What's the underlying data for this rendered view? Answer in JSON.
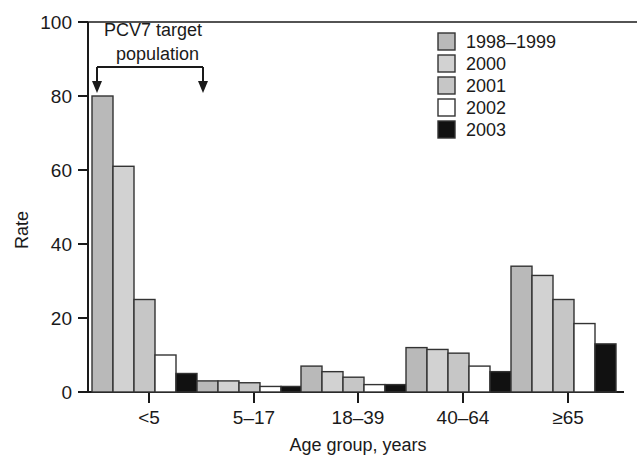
{
  "chart_data": {
    "type": "bar",
    "title": "",
    "xlabel": "Age group, years",
    "ylabel": "Rate",
    "categories": [
      "<5",
      "5–17",
      "18–39",
      "40–64",
      "≥65"
    ],
    "ylim": [
      0,
      100
    ],
    "yticks": [
      0,
      20,
      40,
      60,
      80,
      100
    ],
    "ytick_labels": [
      "0",
      "20",
      "40",
      "60",
      "80",
      "100"
    ],
    "grid": false,
    "legend_position": "top-right",
    "series": [
      {
        "name": "1998–1999",
        "color": "#b9b9b9",
        "values": [
          80,
          3.0,
          7.0,
          12.0,
          34.0
        ]
      },
      {
        "name": "2000",
        "color": "#d2d2d2",
        "values": [
          61,
          3.0,
          5.5,
          11.5,
          31.5
        ]
      },
      {
        "name": "2001",
        "color": "#c6c6c6",
        "values": [
          25,
          2.5,
          4.0,
          10.5,
          25.0
        ]
      },
      {
        "name": "2002",
        "color": "#ffffff",
        "values": [
          10,
          1.5,
          2.0,
          7.0,
          18.5
        ]
      },
      {
        "name": "2003",
        "color": "#111111",
        "values": [
          5,
          1.5,
          2.0,
          5.5,
          13.0
        ]
      }
    ],
    "annotations": [
      {
        "name": "pcv7-target-population",
        "line1": "PCV7 target",
        "line2": "population",
        "style": "bracket-with-down-arrows",
        "spans_category": "<5"
      }
    ]
  },
  "axis": {
    "y_label": "Rate",
    "x_label": "Age group, years",
    "y_ticks": [
      "100",
      "80",
      "60",
      "40",
      "20",
      "0"
    ],
    "x_ticks": [
      "<5",
      "5–17",
      "18–39",
      "40–64",
      "≥65"
    ]
  },
  "legend": {
    "items": [
      {
        "label": "1998–1999",
        "swatch": "#b9b9b9"
      },
      {
        "label": "2000",
        "swatch": "#d2d2d2"
      },
      {
        "label": "2001",
        "swatch": "#c6c6c6"
      },
      {
        "label": "2002",
        "swatch": "#ffffff"
      },
      {
        "label": "2003",
        "swatch": "#111111"
      }
    ]
  },
  "annotation": {
    "line1": "PCV7 target",
    "line2": "population"
  },
  "colors": {
    "axis": "#1a1a1a",
    "bar_stroke": "#333333",
    "background": "#ffffff"
  }
}
